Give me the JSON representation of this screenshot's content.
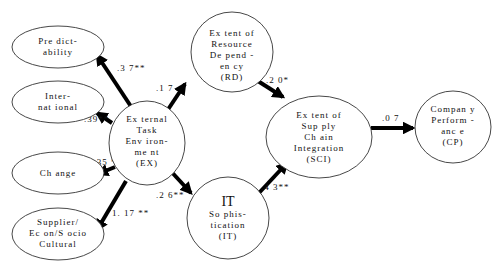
{
  "diagram": {
    "type": "structural-equation-path-model",
    "colors": {
      "node_stroke": "#333333",
      "arrow": "#000000",
      "text": "#111111",
      "background": "#ffffff"
    },
    "nodes": {
      "predictability": {
        "lines": [
          "Pre dict-",
          "ability"
        ]
      },
      "international": {
        "lines": [
          "Inter-",
          "nat ional"
        ]
      },
      "change": {
        "lines": [
          "Ch ange"
        ]
      },
      "supplier": {
        "lines": [
          "Supplier/",
          "Ec on/S ocio",
          "Cultural"
        ]
      },
      "ex": {
        "lines": [
          "Ex ternal",
          "Task",
          "Env iron-",
          "me nt",
          "(EX)"
        ]
      },
      "rd": {
        "lines": [
          "Ex tent of",
          "Resource",
          "De pend -",
          "en cy",
          "(RD)"
        ]
      },
      "it": {
        "title": "IT",
        "lines": [
          "So phis-",
          "tication",
          "(IT)"
        ]
      },
      "sci": {
        "lines": [
          "Ex tent of",
          "Sup ply",
          "Ch ain",
          "Integration",
          "(SCI)"
        ]
      },
      "cp": {
        "lines": [
          "Compan y",
          "Perform -",
          "anc e",
          "(CP)"
        ]
      }
    },
    "edges": [
      {
        "from": "ex",
        "to": "predictability",
        "coef": ".3 7**"
      },
      {
        "from": "ex",
        "to": "international",
        "coef": ".39**"
      },
      {
        "from": "ex",
        "to": "change",
        "coef": "1.35 **"
      },
      {
        "from": "ex",
        "to": "supplier",
        "coef": "1. 17 **"
      },
      {
        "from": "ex",
        "to": "rd",
        "coef": ".1 7"
      },
      {
        "from": "ex",
        "to": "it",
        "coef": ".2 6**"
      },
      {
        "from": "rd",
        "to": "sci",
        "coef": ".2 0*"
      },
      {
        "from": "it",
        "to": "sci",
        "coef": ".4 3**"
      },
      {
        "from": "sci",
        "to": "cp",
        "coef": ".0 7"
      }
    ]
  }
}
